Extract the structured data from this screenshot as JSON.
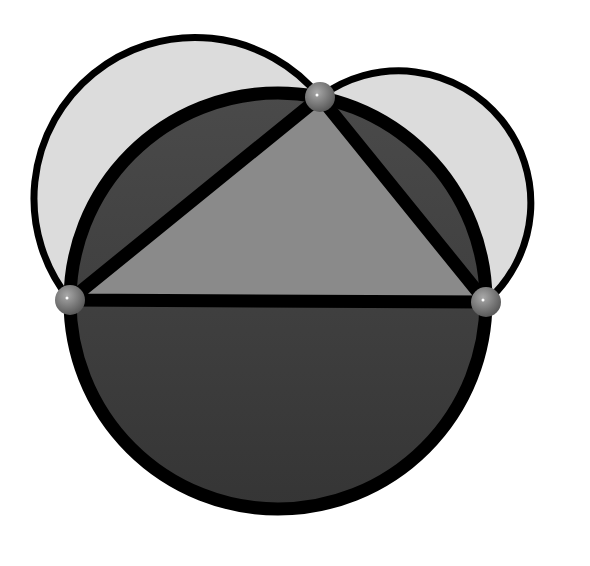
{
  "diagram": {
    "colors": {
      "background": "#ffffff",
      "lune_fill": "#dcdcdc",
      "circle_fill": "#3c3c3c",
      "segment_fill": "#444444",
      "triangle_fill": "#8a8a8a",
      "stroke": "#000000",
      "vertex": "#7a7a7a"
    },
    "vertices": [
      {
        "name": "A",
        "x": 70,
        "y": 300
      },
      {
        "name": "B",
        "x": 320,
        "y": 97
      },
      {
        "name": "C",
        "x": 486,
        "y": 302
      }
    ],
    "circumcircle": {
      "cx": 278,
      "cy": 301,
      "r": 208
    },
    "semicircles": [
      {
        "side": "AB",
        "cx": 195,
        "cy": 198.5,
        "r": 161
      },
      {
        "side": "BC",
        "cx": 403,
        "cy": 199.5,
        "r": 132
      }
    ]
  }
}
